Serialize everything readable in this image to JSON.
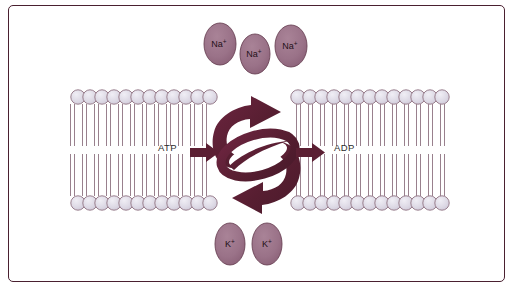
{
  "figure": {
    "background_color": "#ffffff",
    "frame_color": "#4a2030"
  },
  "colors": {
    "head_fill": "#dedbe6",
    "head_stroke": "#9a7f8e",
    "tail_stroke": "#8d7280",
    "ion_fill": "#9d7689",
    "ion_stroke": "#6b4356",
    "arrow_dark": "#5b1f33",
    "arrow_mid": "#6d2540",
    "text": "#2b2b2b"
  },
  "labels": {
    "atp": "ATP",
    "adp": "ADP"
  },
  "ions": {
    "sodium": [
      {
        "text": "Na",
        "charge": "+",
        "cx": 220,
        "cy": 44,
        "rx": 16,
        "ry": 21
      },
      {
        "text": "Na",
        "charge": "+",
        "cx": 255,
        "cy": 54,
        "rx": 15,
        "ry": 20
      },
      {
        "text": "Na",
        "charge": "+",
        "cx": 291,
        "cy": 46,
        "rx": 16,
        "ry": 21
      }
    ],
    "potassium": [
      {
        "text": "K",
        "charge": "+",
        "cx": 230,
        "cy": 244,
        "rx": 15,
        "ry": 21
      },
      {
        "text": "K",
        "charge": "+",
        "cx": 267,
        "cy": 244,
        "rx": 15,
        "ry": 21
      }
    ]
  },
  "membrane": {
    "left_segment": {
      "x_start": 72,
      "x_end": 213,
      "count": 12
    },
    "right_segment": {
      "x_start": 292,
      "x_end": 444,
      "count": 13
    },
    "top_head_cy": 97,
    "bottom_head_cy": 203,
    "head_radius": 7.2,
    "tail_top_y": 104,
    "tail_bottom_y": 196
  },
  "transport_arrows": {
    "atp_in": {
      "label": "ATP",
      "direction": "right",
      "x": 196,
      "y": 152
    },
    "adp_out": {
      "label": "ADP",
      "direction": "right",
      "x": 300,
      "y": 152
    },
    "cycle_up": {
      "direction": "up-right",
      "description": "sodium export arrow"
    },
    "cycle_down": {
      "direction": "down-left",
      "description": "potassium import arrow"
    }
  }
}
